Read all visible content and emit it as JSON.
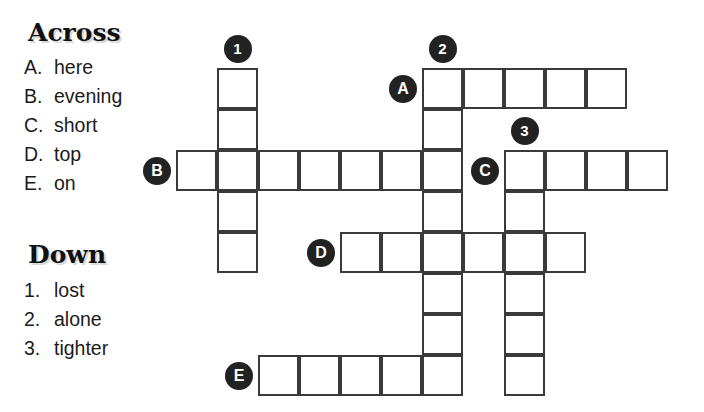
{
  "puzzle": {
    "title_across": "Across",
    "title_down": "Down",
    "across_clues": [
      {
        "marker": "A.",
        "text": "here"
      },
      {
        "marker": "B.",
        "text": "evening"
      },
      {
        "marker": "C.",
        "text": "short"
      },
      {
        "marker": "D.",
        "text": "top"
      },
      {
        "marker": "E.",
        "text": "on"
      }
    ],
    "down_clues": [
      {
        "marker": "1.",
        "text": "lost"
      },
      {
        "marker": "2.",
        "text": "alone"
      },
      {
        "marker": "3.",
        "text": "tighter"
      }
    ],
    "grid": {
      "cell_size": 41,
      "origin_x": 176,
      "origin_y": 68,
      "cells": [
        {
          "col": 6,
          "row": 0
        },
        {
          "col": 7,
          "row": 0
        },
        {
          "col": 8,
          "row": 0
        },
        {
          "col": 9,
          "row": 0
        },
        {
          "col": 10,
          "row": 0
        },
        {
          "col": 1,
          "row": 0
        },
        {
          "col": 1,
          "row": 1
        },
        {
          "col": 6,
          "row": 1
        },
        {
          "col": 0,
          "row": 2
        },
        {
          "col": 1,
          "row": 2
        },
        {
          "col": 2,
          "row": 2
        },
        {
          "col": 3,
          "row": 2
        },
        {
          "col": 4,
          "row": 2
        },
        {
          "col": 5,
          "row": 2
        },
        {
          "col": 6,
          "row": 2
        },
        {
          "col": 8,
          "row": 2
        },
        {
          "col": 9,
          "row": 2
        },
        {
          "col": 10,
          "row": 2
        },
        {
          "col": 11,
          "row": 2
        },
        {
          "col": 1,
          "row": 3
        },
        {
          "col": 6,
          "row": 3
        },
        {
          "col": 8,
          "row": 3
        },
        {
          "col": 4,
          "row": 4
        },
        {
          "col": 5,
          "row": 4
        },
        {
          "col": 6,
          "row": 4
        },
        {
          "col": 7,
          "row": 4
        },
        {
          "col": 8,
          "row": 4
        },
        {
          "col": 9,
          "row": 4
        },
        {
          "col": 1,
          "row": 4
        },
        {
          "col": 6,
          "row": 5
        },
        {
          "col": 8,
          "row": 5
        },
        {
          "col": 6,
          "row": 6
        },
        {
          "col": 8,
          "row": 6
        },
        {
          "col": 2,
          "row": 7
        },
        {
          "col": 3,
          "row": 7
        },
        {
          "col": 4,
          "row": 7
        },
        {
          "col": 5,
          "row": 7
        },
        {
          "col": 6,
          "row": 7
        },
        {
          "col": 8,
          "row": 7
        }
      ],
      "markers": [
        {
          "label": "1",
          "kind": "num",
          "col": 1,
          "row": 0,
          "place": "above"
        },
        {
          "label": "2",
          "kind": "num",
          "col": 6,
          "row": 0,
          "place": "above"
        },
        {
          "label": "3",
          "kind": "num",
          "col": 8,
          "row": 2,
          "place": "above"
        },
        {
          "label": "A",
          "kind": "letter",
          "col": 6,
          "row": 0,
          "place": "left"
        },
        {
          "label": "B",
          "kind": "letter",
          "col": 0,
          "row": 2,
          "place": "left"
        },
        {
          "label": "C",
          "kind": "letter",
          "col": 8,
          "row": 2,
          "place": "left"
        },
        {
          "label": "D",
          "kind": "letter",
          "col": 4,
          "row": 4,
          "place": "left"
        },
        {
          "label": "E",
          "kind": "letter",
          "col": 2,
          "row": 7,
          "place": "left"
        }
      ]
    }
  },
  "colors": {
    "grid_line": "#3a3a3a",
    "marker_fill": "#222222",
    "marker_text": "#ffffff",
    "page_background": "#ffffff",
    "text": "#1b1b1b"
  }
}
